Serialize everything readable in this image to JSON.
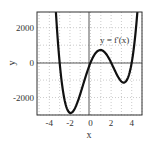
{
  "chart_data": {
    "type": "line",
    "title": "",
    "xlabel": "x",
    "ylabel": "y",
    "xlim": [
      -5.2,
      5.0
    ],
    "ylim": [
      -3000,
      2900
    ],
    "grid": true,
    "grid_style": "dotted",
    "x_ticks": [
      -4,
      -2,
      0,
      2,
      4
    ],
    "x_tick_labels": [
      "-4",
      "-2",
      "0",
      "2",
      "4"
    ],
    "y_ticks": [
      -2000,
      0,
      2000
    ],
    "y_tick_labels": [
      "-2000",
      "0",
      "2000"
    ],
    "x_gridlines": [
      -5,
      -4,
      -3,
      -2,
      -1,
      0,
      1,
      2,
      3,
      4,
      5
    ],
    "y_gridlines": [
      -3000,
      -2000,
      -1000,
      0,
      1000,
      2000
    ],
    "annotations": [
      {
        "text": "y = f'(x)",
        "x": 2.6,
        "y": 1350
      }
    ],
    "series": [
      {
        "name": "y = f'(x)",
        "formula": "60*x*(x+3)*(x-2)*(x-4)",
        "color": "#111111",
        "x": [
          -3.6,
          -3.4,
          -3.2,
          -3.0,
          -2.8,
          -2.6,
          -2.4,
          -2.2,
          -2.0,
          -1.8,
          -1.6,
          -1.4,
          -1.2,
          -1.0,
          -0.8,
          -0.6,
          -0.4,
          -0.2,
          0.0,
          0.2,
          0.4,
          0.6,
          0.8,
          1.0,
          1.2,
          1.4,
          1.6,
          1.8,
          2.0,
          2.2,
          2.4,
          2.6,
          2.8,
          3.0,
          3.2,
          3.4,
          3.6,
          3.8,
          4.0,
          4.2,
          4.4,
          4.6
        ],
        "values": [
          3148,
          1922,
          989,
          0,
          -775,
          -1458,
          -2051,
          -2556,
          -2880,
          -3032,
          -3020,
          -2862,
          -2575,
          -2160,
          -1638,
          -1104,
          -640,
          -280,
          0,
          194,
          376,
          537,
          670,
          720,
          645,
          474,
          276,
          91,
          0,
          -121,
          -297,
          -493,
          -652,
          -720,
          -735,
          -635,
          -401,
          -104,
          0,
          538,
          1331,
          2446
        ]
      }
    ]
  },
  "labels": {
    "xlabel": "x",
    "ylabel": "y",
    "curve_label": "y = f'(x)",
    "x_ticks": [
      "-4",
      "-2",
      "0",
      "2",
      "4"
    ],
    "y_ticks": [
      "2000",
      "0",
      "-2000"
    ]
  }
}
